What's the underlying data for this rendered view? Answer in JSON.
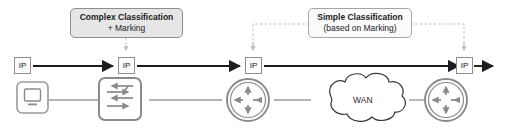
{
  "diagram": {
    "background_color": "#ffffff",
    "annotations": [
      {
        "name": "complex-classification",
        "line1": "Complex Classification",
        "line2": "+ Marking",
        "style": "shaded",
        "fill": "#e6e6e6",
        "border": "#8f8f8f"
      },
      {
        "name": "simple-classification",
        "line1": "Simple Classification",
        "line2": "(based on Marking)",
        "style": "plain",
        "fill": "#fbfbfb",
        "border": "#a5a5a5"
      }
    ],
    "packets": [
      {
        "name": "packet-1",
        "label": "IP"
      },
      {
        "name": "packet-2",
        "label": "IP"
      },
      {
        "name": "packet-3",
        "label": "IP"
      },
      {
        "name": "packet-4",
        "label": "IP"
      }
    ],
    "devices": [
      {
        "name": "workstation",
        "icon": "monitor-icon",
        "label": ""
      },
      {
        "name": "switch",
        "icon": "switch-icon",
        "label": ""
      },
      {
        "name": "router-left",
        "icon": "router-icon",
        "label": ""
      },
      {
        "name": "wan-cloud",
        "icon": "cloud-icon",
        "label": "WAN"
      },
      {
        "name": "router-right",
        "icon": "router-icon",
        "label": ""
      }
    ],
    "colors": {
      "flow_arrow": "#1d1d1d",
      "device_outline": "#8a8a8a",
      "device_glyph": "#8a8a8a",
      "link_line": "#9c9c9c",
      "pointer_dashed": "#bdbdbd",
      "cloud_outline": "#3a3a3a",
      "packet_border": "#8e8e8e",
      "text": "#1a1a1a"
    }
  }
}
